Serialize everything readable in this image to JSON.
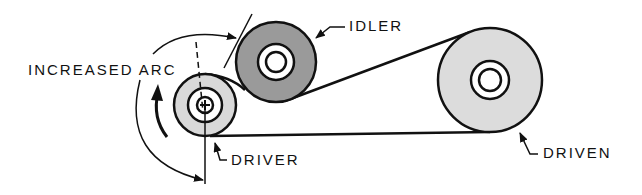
{
  "labels": {
    "increased_arc": "INCREASED ARC",
    "idler": "IDLER",
    "driver": "DRIVER",
    "driven": "DRIVEN"
  },
  "colors": {
    "line": "#111111",
    "driver_fill": "#d9d9d9",
    "idler_fill": "#9a9a9a",
    "driven_fill": "#dcdcdc",
    "background": "#ffffff"
  },
  "pulleys": [
    {
      "name": "driver",
      "cx": 205,
      "cy": 105,
      "r": 31,
      "ring_r": 17,
      "hub_r": 9
    },
    {
      "name": "idler",
      "cx": 276,
      "cy": 62,
      "r": 40,
      "ring_r": 18,
      "hub_r": 10
    },
    {
      "name": "driven",
      "cx": 490,
      "cy": 80,
      "r": 52,
      "ring_r": 19,
      "hub_r": 11
    }
  ]
}
